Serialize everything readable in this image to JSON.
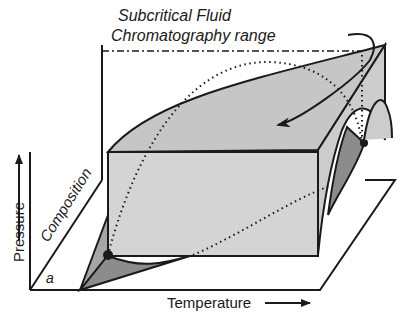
{
  "diagram": {
    "title_line1": "Subcritical Fluid",
    "title_line2": "Chromatography range",
    "axes": {
      "x_label": "Temperature",
      "y_label": "Pressure",
      "z_label": "Composition"
    },
    "point_label": "a",
    "colors": {
      "surface_light": "#d4d4d4",
      "surface_mid": "#c2c2c2",
      "surface_dark": "#8c8c8c",
      "line": "#1a1a1a",
      "background": "#ffffff"
    }
  }
}
